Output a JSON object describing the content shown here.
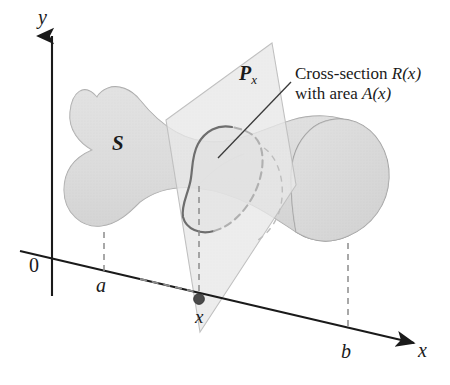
{
  "figure": {
    "domain": "math-diagram"
  },
  "axes": {
    "y_label": "y",
    "x_label": "x",
    "origin_label": "0"
  },
  "marks": {
    "a_label": "a",
    "b_label": "b",
    "x_point_label": "x"
  },
  "solid": {
    "label": "S",
    "fill_color": "#dcdcdc",
    "stroke_color": "#9a9a9a"
  },
  "plane": {
    "label_base": "P",
    "label_sub": "x",
    "fill_color": "#ececec",
    "stroke_color": "#b5b5b5"
  },
  "cross_section": {
    "callout_line1_prefix": "Cross-section ",
    "callout_line1_math": "R(x)",
    "callout_line2_prefix": "with area ",
    "callout_line2_math": "A(x)",
    "visible_stroke_color": "#6e6e6e",
    "hidden_stroke_color": "#b0b0b0"
  },
  "colors": {
    "ink": "#1a1a1a",
    "dashed": "#8c8c8c",
    "point": "#4a4a4a",
    "background": "#ffffff"
  }
}
